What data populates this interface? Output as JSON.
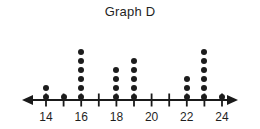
{
  "chart_data": {
    "type": "dotplot",
    "title": "Graph D",
    "xlabel": "",
    "ylabel": "",
    "xlim": [
      13.2,
      24.8
    ],
    "grid": false,
    "legend": null,
    "dot_color": "#1c1c1c",
    "axis_color": "#1a1a1a",
    "x": [
      14,
      15,
      16,
      17,
      18,
      19,
      20,
      21,
      22,
      23,
      24
    ],
    "counts": [
      2,
      1,
      6,
      0,
      4,
      5,
      0,
      0,
      3,
      6,
      1
    ],
    "tick_values": [
      14,
      15,
      16,
      17,
      18,
      19,
      20,
      21,
      22,
      23,
      24
    ],
    "tick_labels": [
      "14",
      "",
      "16",
      "",
      "18",
      "",
      "20",
      "",
      "22",
      "",
      "24"
    ],
    "labeled_ticks": [
      {
        "value": 14,
        "label": "14"
      },
      {
        "value": 16,
        "label": "16"
      },
      {
        "value": 18,
        "label": "18"
      },
      {
        "value": 20,
        "label": "20"
      },
      {
        "value": 22,
        "label": "22"
      },
      {
        "value": 24,
        "label": "24"
      }
    ],
    "axis_arrows": [
      "left",
      "right"
    ],
    "total_dots": 28
  }
}
